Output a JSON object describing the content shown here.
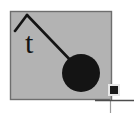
{
  "figure": {
    "caption": "",
    "label": "t",
    "panel": {
      "fill": "#b3b3b3",
      "stroke": "#6e6e6e",
      "x": 10,
      "y": 11,
      "width": 102,
      "height": 89
    },
    "ink_color": "#141414",
    "background": "#ffffff"
  },
  "elements": {
    "pivot_support": {
      "name": "caret-pivot",
      "apex_x": 27,
      "apex_y": 15,
      "left_foot_x": 15,
      "left_foot_y": 31
    },
    "rod": {
      "name": "pendulum-rod",
      "from_x": 27,
      "from_y": 15,
      "to_x": 73,
      "to_y": 63
    },
    "bob": {
      "name": "pendulum-bob",
      "cx": 81,
      "cy": 73,
      "r": 19,
      "fill": "#141414"
    },
    "marker_square": {
      "name": "corner-square-marker",
      "x": 110,
      "y": 86,
      "size": 8,
      "fill": "#1a1a1a"
    },
    "axis_vertical": {
      "name": "vertical-rule",
      "x": 110,
      "y1": 80,
      "y2": 113
    },
    "axis_horizontal": {
      "name": "horizontal-rule",
      "y": 100,
      "x1": 95,
      "x2": 134
    }
  },
  "text": {
    "t_label": "t"
  }
}
